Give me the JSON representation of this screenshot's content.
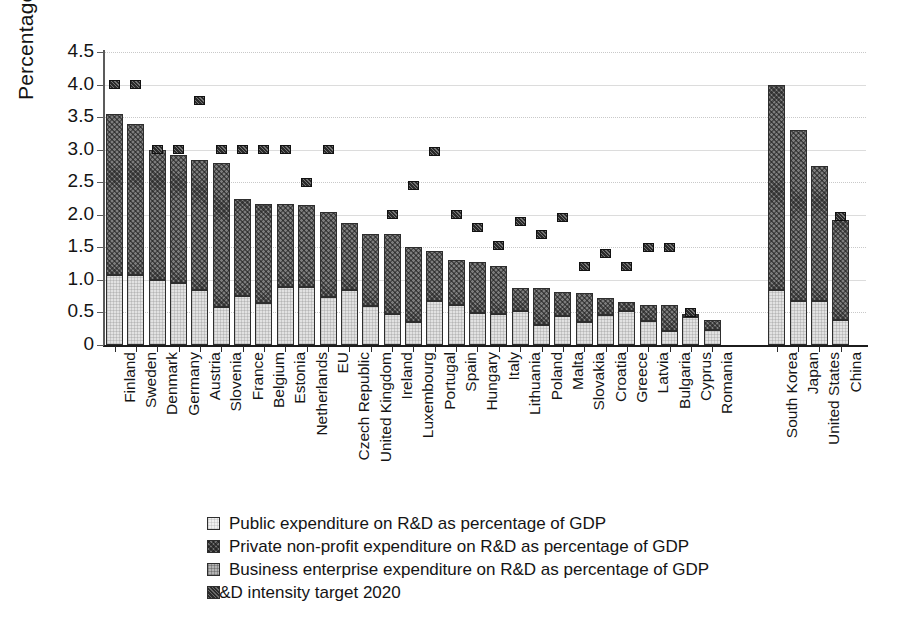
{
  "chart_data": {
    "type": "bar",
    "title": "",
    "xlabel": "",
    "ylabel": "Percentage",
    "ylim": [
      0,
      4.5
    ],
    "ytick_labels": [
      "0",
      "0.5",
      "1.0",
      "1.5",
      "2.0",
      "2.5",
      "3.0",
      "3.5",
      "4.0",
      "4.5"
    ],
    "ytick_values": [
      0,
      0.5,
      1.0,
      1.5,
      2.0,
      2.5,
      3.0,
      3.5,
      4.0,
      4.5
    ],
    "grid": true,
    "stacked": true,
    "legend_position": "bottom-left",
    "group_gap_after_index": 28,
    "categories": [
      "Finland",
      "Sweden",
      "Denmark",
      "Germany",
      "Austria",
      "Slovenia",
      "France",
      "Belgium",
      "Estonia",
      "Netherlands",
      "EU",
      "Czech Republic",
      "United Kingdom",
      "Ireland",
      "Luxembourg",
      "Portugal",
      "Spain",
      "Hungary",
      "Italy",
      "Lithuania",
      "Poland",
      "Malta",
      "Slovakia",
      "Croatia",
      "Greece",
      "Latvia",
      "Bulgaria",
      "Cyprus",
      "Romania",
      "South Korea",
      "Japan",
      "United States",
      "China"
    ],
    "series": [
      {
        "name": "Public expenditure on R&D as percentage of GDP",
        "key": "public",
        "values": [
          1.08,
          1.08,
          1.0,
          0.96,
          0.84,
          0.58,
          0.75,
          0.64,
          0.89,
          0.89,
          0.73,
          0.84,
          0.6,
          0.47,
          0.35,
          0.67,
          0.62,
          0.49,
          0.48,
          0.53,
          0.31,
          0.44,
          0.36,
          0.46,
          0.52,
          0.37,
          0.21,
          0.43,
          0.23,
          0.85,
          0.68,
          0.67,
          0.39
        ]
      },
      {
        "name": "Private non-profit expenditure on R&D as percentage of GDP",
        "key": "nonprofit",
        "values": [
          2.47,
          2.32,
          2.0,
          1.96,
          2.0,
          2.22,
          1.5,
          1.53,
          1.27,
          1.26,
          1.32,
          1.03,
          1.1,
          1.23,
          1.15,
          0.78,
          0.68,
          0.78,
          0.74,
          0.35,
          0.56,
          0.37,
          0.44,
          0.26,
          0.14,
          0.25,
          0.4,
          0.05,
          0.16,
          3.15,
          2.63,
          2.08,
          1.53
        ]
      }
    ],
    "totals": [
      3.55,
      3.4,
      3.0,
      2.92,
      2.84,
      2.8,
      2.25,
      2.17,
      2.16,
      2.15,
      2.05,
      1.87,
      1.7,
      1.7,
      1.5,
      1.45,
      1.3,
      1.27,
      1.22,
      0.88,
      0.87,
      0.81,
      0.8,
      0.72,
      0.66,
      0.62,
      0.61,
      0.48,
      0.39,
      4.0,
      3.31,
      2.75,
      1.92
    ],
    "target_series": {
      "name": "R&D intensity target 2020",
      "key": "target",
      "values": [
        4.0,
        4.0,
        3.0,
        3.0,
        3.76,
        3.0,
        3.0,
        3.0,
        3.0,
        2.5,
        3.0,
        null,
        null,
        2.0,
        2.45,
        2.97,
        2.0,
        1.8,
        1.53,
        1.9,
        1.7,
        1.96,
        1.2,
        1.4,
        1.2,
        1.5,
        1.5,
        0.5,
        null,
        null,
        null,
        null,
        1.97
      ]
    }
  },
  "legend": {
    "items": [
      {
        "label": "Public expenditure on R&D as percentage of GDP",
        "swatch": "public"
      },
      {
        "label": "Private non-profit expenditure on R&D as percentage of GDP",
        "swatch": "nonprofit"
      },
      {
        "label": "Business enterprise expenditure on R&D as percentage of GDP",
        "swatch": "business"
      },
      {
        "label": "R&D intensity target 2020",
        "swatch": "target"
      }
    ]
  },
  "colors": {
    "public": "#e2e2e2",
    "business": "#a8a8a8",
    "nonprofit": "#7d7d7d",
    "target": "#2a2a2a",
    "axis": "#1c1c1c",
    "grid": "#dcdcdc"
  }
}
